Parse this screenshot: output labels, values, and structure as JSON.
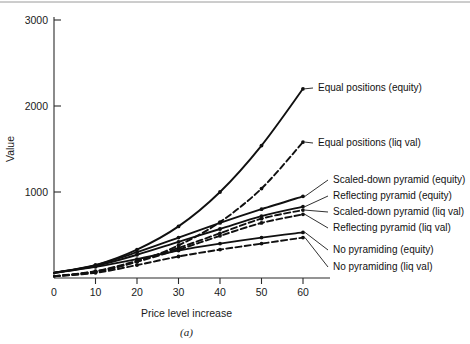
{
  "figure": {
    "caption": "(a)"
  },
  "chart_data": {
    "type": "line",
    "title": "",
    "xlabel": "Price level increase",
    "ylabel": "Value",
    "xlim": [
      0,
      63
    ],
    "ylim": [
      0,
      3100
    ],
    "grid": false,
    "legend_position": "right-inline-labels",
    "xticks": [
      0,
      10,
      20,
      30,
      40,
      50,
      60
    ],
    "xtick_labels": [
      "0",
      "10",
      "20",
      "30",
      "40",
      "50",
      "60"
    ],
    "yticks": [
      0,
      1000,
      2000,
      3000
    ],
    "ytick_labels": [
      "0",
      "1000",
      "2000",
      "3000"
    ],
    "x": [
      0,
      10,
      20,
      30,
      40,
      50,
      60
    ],
    "series": [
      {
        "name": "Equal positions (equity)",
        "style": "solid",
        "values": [
          60,
          150,
          330,
          600,
          1000,
          1540,
          2200
        ],
        "label_anchor": {
          "x": 60,
          "y": 2200
        }
      },
      {
        "name": "Equal positions (liq val)",
        "style": "dashed",
        "values": [
          20,
          70,
          190,
          380,
          650,
          1040,
          1580
        ],
        "label_anchor": {
          "x": 60,
          "y": 1580
        }
      },
      {
        "name": "Scaled-down pyramid (equity)",
        "style": "solid",
        "values": [
          60,
          150,
          300,
          470,
          640,
          800,
          950
        ],
        "label_anchor": {
          "x": 60,
          "y": 950
        }
      },
      {
        "name": "Reflecting pyramid (equity)",
        "style": "solid",
        "values": [
          60,
          140,
          270,
          420,
          570,
          720,
          830
        ],
        "label_anchor": {
          "x": 60,
          "y": 830
        }
      },
      {
        "name": "Scaled-down pyramid (liq val)",
        "style": "dashed",
        "values": [
          20,
          80,
          200,
          350,
          520,
          690,
          790
        ],
        "label_anchor": {
          "x": 60,
          "y": 790
        }
      },
      {
        "name": "Reflecting pyramid (liq val)",
        "style": "dashed",
        "values": [
          20,
          75,
          190,
          330,
          490,
          640,
          740
        ],
        "label_anchor": {
          "x": 60,
          "y": 740
        }
      },
      {
        "name": "No pyramiding (equity)",
        "style": "solid",
        "values": [
          60,
          130,
          220,
          320,
          400,
          470,
          530
        ],
        "label_anchor": {
          "x": 60,
          "y": 530
        }
      },
      {
        "name": "No pyramiding (liq val)",
        "style": "dashed",
        "values": [
          20,
          60,
          150,
          250,
          330,
          400,
          470
        ],
        "label_anchor": {
          "x": 60,
          "y": 470
        }
      }
    ],
    "annotations": [
      {
        "text": "Equal positions (equity)",
        "series_index": 0,
        "tx": 318,
        "ty": 88
      },
      {
        "text": "Equal positions (liq val)",
        "series_index": 1,
        "tx": 318,
        "ty": 143
      },
      {
        "text": "Scaled-down pyramid (equity)",
        "series_index": 2,
        "tx": 333,
        "ty": 180
      },
      {
        "text": "Reflecting pyramid (equity)",
        "series_index": 3,
        "tx": 333,
        "ty": 196
      },
      {
        "text": "Scaled-down pyramid (liq val)",
        "series_index": 4,
        "tx": 333,
        "ty": 212
      },
      {
        "text": "Reflecting pyramid (liq val)",
        "series_index": 5,
        "tx": 333,
        "ty": 228
      },
      {
        "text": "No pyramiding (equity)",
        "series_index": 6,
        "tx": 333,
        "ty": 250
      },
      {
        "text": "No pyramiding (liq val)",
        "series_index": 7,
        "tx": 333,
        "ty": 267
      }
    ]
  }
}
